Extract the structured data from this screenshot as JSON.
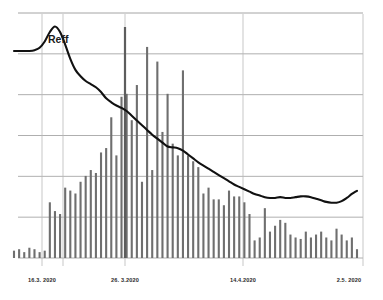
{
  "chart_data": {
    "type": "bar",
    "title": "",
    "subtitle": "",
    "xlabel": "",
    "ylabel": "",
    "grid": true,
    "gridlines_horizontal": 7,
    "legend_position": "inline-annotation",
    "annotations": [
      {
        "text": "Reff",
        "x_px": 48,
        "y_px": 33
      }
    ],
    "x_tick_labels": [
      "16.3. 2020",
      "26. 3.2020",
      "14.4.2020",
      "2.5. 2020"
    ],
    "x_tick_positions": [
      42,
      125,
      243,
      363
    ],
    "vertical_marker_lines": [
      42,
      63,
      125,
      243,
      363
    ],
    "categories": [
      "2020-02-25",
      "2020-02-26",
      "2020-02-27",
      "2020-02-28",
      "2020-02-29",
      "2020-03-01",
      "2020-03-02",
      "2020-03-03",
      "2020-03-04",
      "2020-03-05",
      "2020-03-06",
      "2020-03-07",
      "2020-03-08",
      "2020-03-09",
      "2020-03-10",
      "2020-03-11",
      "2020-03-12",
      "2020-03-13",
      "2020-03-14",
      "2020-03-15",
      "2020-03-16",
      "2020-03-17",
      "2020-03-18",
      "2020-03-19",
      "2020-03-20",
      "2020-03-21",
      "2020-03-22",
      "2020-03-23",
      "2020-03-24",
      "2020-03-25",
      "2020-03-26",
      "2020-03-27",
      "2020-03-28",
      "2020-03-29",
      "2020-03-30",
      "2020-03-31",
      "2020-04-01",
      "2020-04-02",
      "2020-04-03",
      "2020-04-04",
      "2020-04-05",
      "2020-04-06",
      "2020-04-07",
      "2020-04-08",
      "2020-04-09",
      "2020-04-10",
      "2020-04-11",
      "2020-04-12",
      "2020-04-13",
      "2020-04-14",
      "2020-04-15",
      "2020-04-16",
      "2020-04-17",
      "2020-04-18",
      "2020-04-19",
      "2020-04-20",
      "2020-04-21",
      "2020-04-22",
      "2020-04-23",
      "2020-04-24",
      "2020-04-25",
      "2020-04-26",
      "2020-04-27",
      "2020-04-28",
      "2020-04-29",
      "2020-04-30",
      "2020-05-01",
      "2020-05-02"
    ],
    "series": [
      {
        "name": "daily cases",
        "type": "bar",
        "color": "#6f6f6f",
        "values": [
          5,
          6,
          4,
          7,
          6,
          4,
          5,
          38,
          32,
          30,
          48,
          46,
          44,
          52,
          56,
          60,
          58,
          72,
          75,
          96,
          70,
          110,
          112,
          94,
          118,
          52,
          144,
          60,
          134,
          86,
          112,
          78,
          70,
          128,
          70,
          66,
          62,
          44,
          48,
          40,
          40,
          36,
          46,
          42,
          42,
          38,
          30,
          12,
          14,
          34,
          18,
          22,
          26,
          24,
          16,
          14,
          13,
          18,
          14,
          16,
          18,
          14,
          12,
          20,
          16,
          12,
          14,
          6
        ]
      },
      {
        "name": "Reff",
        "type": "line",
        "color": "#111111",
        "values": [
          2.62,
          2.62,
          2.62,
          2.62,
          2.63,
          2.66,
          2.74,
          2.86,
          2.93,
          2.86,
          2.7,
          2.52,
          2.38,
          2.3,
          2.24,
          2.2,
          2.16,
          2.1,
          2.02,
          1.97,
          1.93,
          1.9,
          1.86,
          1.8,
          1.74,
          1.68,
          1.62,
          1.56,
          1.51,
          1.46,
          1.41,
          1.4,
          1.39,
          1.36,
          1.31,
          1.26,
          1.21,
          1.17,
          1.13,
          1.09,
          1.05,
          1.01,
          0.97,
          0.93,
          0.9,
          0.87,
          0.84,
          0.81,
          0.79,
          0.77,
          0.76,
          0.76,
          0.77,
          0.76,
          0.76,
          0.77,
          0.78,
          0.78,
          0.77,
          0.75,
          0.73,
          0.71,
          0.7,
          0.7,
          0.72,
          0.76,
          0.81,
          0.85
        ]
      }
    ],
    "outlier_bar": {
      "index": 20,
      "label": "2020-03-16",
      "note": "single very tall bar extending above top gridline",
      "x_px": 125,
      "top_y_px": 27
    },
    "ylim": [
      0,
      3.1
    ],
    "bar_baseline_y_px": 258,
    "plot_left_px": 20,
    "plot_right_px": 363,
    "plot_top_px": 13,
    "plot_bottom_px": 258
  },
  "colors": {
    "background": "#ffffff",
    "gridline": "#9a9a9a",
    "marker_line": "#b9b9b9",
    "bar": "#6f6f6f",
    "curve": "#111111",
    "label_text": "#2b2b2b"
  }
}
